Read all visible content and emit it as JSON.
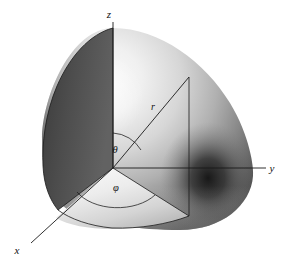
{
  "figure": {
    "type": "geometry-diagram",
    "width": 288,
    "height": 266,
    "background_color": "#ffffff",
    "stroke_color": "#111111"
  },
  "axes": [
    {
      "id": "z",
      "label": "z",
      "direction": "up",
      "label_x": 112,
      "label_y": 14,
      "from": [
        113,
        168
      ],
      "to": [
        113,
        22
      ]
    },
    {
      "id": "y",
      "label": "y",
      "direction": "right",
      "label_x": 271,
      "label_y": 171,
      "from": [
        113,
        168
      ],
      "to": [
        266,
        168
      ]
    },
    {
      "id": "x",
      "label": "x",
      "direction": "down-left",
      "label_x": 15,
      "label_y": 253,
      "from": [
        113,
        168
      ],
      "to": [
        31,
        243
      ]
    }
  ],
  "vectors": [
    {
      "id": "r",
      "label": "r",
      "description": "radial distance from origin to point P",
      "label_x": 152,
      "label_y": 109,
      "from": [
        113,
        168
      ],
      "to": [
        189,
        77
      ]
    }
  ],
  "angles": [
    {
      "id": "theta",
      "label": "θ",
      "description": "polar angle measured from the positive z-axis",
      "label_x": 114,
      "label_y": 152,
      "between": [
        "z",
        "r"
      ]
    },
    {
      "id": "phi",
      "label": "φ",
      "description": "azimuthal angle measured in the xy-plane from the x-axis",
      "label_x": 114,
      "label_y": 190,
      "between": [
        "x",
        "projection-of-r"
      ]
    }
  ],
  "construction_lines": [
    {
      "id": "drop-line",
      "description": "vertical segment from point P down to the xy-plane",
      "from": [
        189,
        77
      ],
      "to": [
        189,
        216
      ]
    },
    {
      "id": "projection-line",
      "description": "segment in the xy-plane from origin to the foot of the drop line",
      "from": [
        113,
        168
      ],
      "to": [
        189,
        216
      ]
    }
  ],
  "surface": {
    "id": "sphere-octant",
    "description": "shaded sphere with one octant cut away",
    "center": [
      113,
      168
    ],
    "radius": 140,
    "highlight_color": "#f2f2f2",
    "midtone_color": "#b4b4b4",
    "shadow_color": "#4a4a4a",
    "deep_shadow_color": "#222222"
  }
}
